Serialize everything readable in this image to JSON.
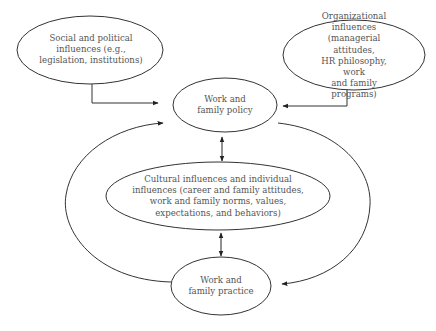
{
  "diagram": {
    "nodes": {
      "social": {
        "label": "Social and political\ninfluences (e.g.,\nlegislation, institutions)"
      },
      "organizational": {
        "label": "Organizational influences\n(managerial attitudes,\nHR philosophy, work\nand family programs)"
      },
      "policy": {
        "label": "Work and\nfamily policy"
      },
      "cultural": {
        "label": "Cultural influences and individual\ninfluences (career and family attitudes,\nwork and family norms, values,\nexpectations, and behaviors)"
      },
      "practice": {
        "label": "Work and\nfamily practice"
      }
    },
    "edges": [
      {
        "from": "social",
        "to": "policy",
        "type": "elbow-arrow"
      },
      {
        "from": "organizational",
        "to": "policy",
        "type": "elbow-arrow"
      },
      {
        "from": "policy",
        "to": "cultural",
        "type": "bidirectional"
      },
      {
        "from": "cultural",
        "to": "practice",
        "type": "bidirectional"
      },
      {
        "from": "practice",
        "to": "policy",
        "type": "curved-arrow-left"
      },
      {
        "from": "policy",
        "to": "practice",
        "type": "curved-arrow-right"
      }
    ],
    "colors": {
      "stroke": "#333333",
      "text": "#555555",
      "background": "#ffffff"
    }
  }
}
